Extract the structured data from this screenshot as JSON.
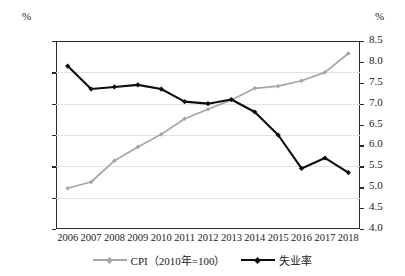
{
  "axes": {
    "left_unit": "%",
    "right_unit": "%",
    "left_ticks": [
      "130",
      "120",
      "110",
      "100",
      "90",
      "80",
      "70"
    ],
    "right_ticks": [
      "8.5",
      "8.0",
      "7.5",
      "7.0",
      "6.5",
      "6.0",
      "5.5",
      "5.0",
      "4.5",
      "4.0"
    ]
  },
  "legend": [
    {
      "label": "CPI（2010年=100）",
      "color": "#a6a6a6",
      "marker": "diamond"
    },
    {
      "label": "失业率",
      "color": "#0d0d0d",
      "marker": "diamond"
    }
  ],
  "chart_data": {
    "type": "line",
    "title": "",
    "xlabel": "",
    "ylabel": "%",
    "y2label": "%",
    "grid": true,
    "legend_position": "bottom",
    "categories": [
      "2006",
      "2007",
      "2008",
      "2009",
      "2010",
      "2011",
      "2012",
      "2013",
      "2014",
      "2015",
      "2016",
      "2017",
      "2018"
    ],
    "ylim": [
      70,
      130
    ],
    "y2lim": [
      4.0,
      8.5
    ],
    "series": [
      {
        "name": "CPI（2010年=100）",
        "axis": "left",
        "color": "#a6a6a6",
        "values": [
          83.0,
          85.0,
          91.8,
          96.2,
          100.2,
          105.2,
          108.2,
          111.2,
          114.9,
          115.6,
          117.3,
          120.0,
          126.0
        ]
      },
      {
        "name": "失业率",
        "axis": "right",
        "color": "#0d0d0d",
        "values": [
          7.9,
          7.35,
          7.4,
          7.45,
          7.35,
          7.05,
          7.0,
          7.1,
          6.8,
          6.25,
          5.45,
          5.7,
          5.35
        ]
      }
    ]
  }
}
